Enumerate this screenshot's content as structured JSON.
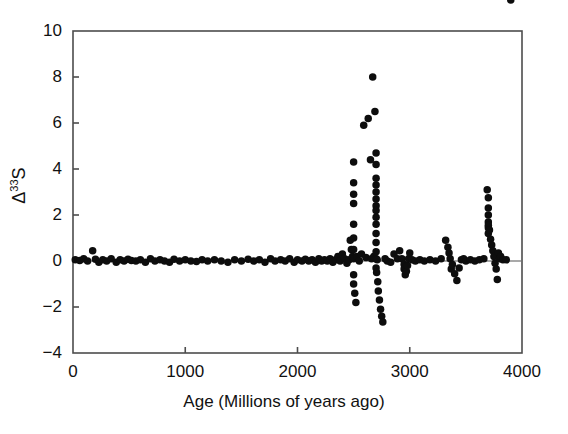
{
  "figure": {
    "background_color": "#ffffff",
    "axis_color": "#4d4d4d",
    "marker_color": "#0d0d0d",
    "zero_line_color": "#555555"
  },
  "axes": {
    "x_title": "Age (Millions of years ago)",
    "y_title_prefix": "Δ",
    "y_title_superscript": "33",
    "y_title_suffix": "S",
    "x_ticks": [
      0,
      1000,
      2000,
      3000,
      4000
    ],
    "x_tick_labels": [
      "0",
      "1000",
      "2000",
      "3000",
      "4000"
    ],
    "y_ticks": [
      -4,
      -2,
      0,
      2,
      4,
      6,
      8,
      10
    ],
    "y_tick_labels": [
      "-4",
      "-2",
      "0",
      "2",
      "4",
      "6",
      "8",
      "10"
    ]
  },
  "chart_data": {
    "type": "scatter",
    "title": "",
    "xlabel": "Age (Millions of years ago)",
    "ylabel": "Δ33S",
    "xlim": [
      0,
      4000
    ],
    "ylim": [
      -4,
      10
    ],
    "grid": false,
    "legend": "none",
    "marker": "filled-circle",
    "marker_color": "#0d0d0d",
    "marker_size_px": 7.5,
    "annotations": [
      "horizontal reference line at Δ33S = 0"
    ],
    "reference_lines": [
      {
        "axis": "y",
        "value": 0
      }
    ],
    "x": [
      20,
      60,
      95,
      130,
      175,
      200,
      230,
      265,
      300,
      340,
      385,
      420,
      455,
      490,
      520,
      560,
      600,
      645,
      690,
      730,
      775,
      815,
      860,
      900,
      950,
      1000,
      1050,
      1100,
      1150,
      1200,
      1260,
      1320,
      1380,
      1440,
      1500,
      1560,
      1610,
      1660,
      1710,
      1760,
      1800,
      1850,
      1890,
      1930,
      1970,
      2000,
      2040,
      2070,
      2100,
      2130,
      2160,
      2190,
      2215,
      2240,
      2265,
      2290,
      2315,
      2340,
      2360,
      2380,
      2400,
      2420,
      2440,
      2460,
      2470,
      2480,
      2490,
      2500,
      2500,
      2500,
      2500,
      2500,
      2500,
      2500,
      2500,
      2500,
      2500,
      2510,
      2520,
      2530,
      2550,
      2570,
      2590,
      2610,
      2630,
      2650,
      2660,
      2670,
      2680,
      2690,
      2700,
      2700,
      2700,
      2700,
      2700,
      2700,
      2700,
      2700,
      2700,
      2700,
      2700,
      2700,
      2700,
      2700,
      2700,
      2705,
      2710,
      2715,
      2720,
      2730,
      2740,
      2750,
      2760,
      2780,
      2800,
      2830,
      2860,
      2890,
      2910,
      2930,
      2950,
      2950,
      2960,
      2970,
      2980,
      2990,
      3000,
      3020,
      3050,
      3090,
      3130,
      3180,
      3230,
      3280,
      3320,
      3340,
      3350,
      3360,
      3370,
      3380,
      3400,
      3420,
      3440,
      3460,
      3480,
      3500,
      3540,
      3580,
      3620,
      3660,
      3690,
      3700,
      3700,
      3700,
      3700,
      3700,
      3700,
      3700,
      3710,
      3720,
      3730,
      3740,
      3750,
      3760,
      3770,
      3780,
      3790,
      3800,
      3810,
      3830,
      3860,
      3900
    ],
    "y": [
      0.05,
      0.02,
      0.1,
      0.0,
      0.45,
      0.08,
      -0.05,
      0.05,
      0.0,
      0.1,
      -0.05,
      0.05,
      0.0,
      0.08,
      0.02,
      0.0,
      0.05,
      -0.05,
      0.1,
      0.0,
      0.05,
      0.0,
      -0.05,
      0.08,
      0.0,
      0.05,
      0.0,
      -0.02,
      0.05,
      0.0,
      0.05,
      0.0,
      -0.05,
      0.05,
      0.0,
      0.08,
      0.0,
      0.05,
      -0.05,
      0.1,
      0.0,
      0.05,
      0.0,
      0.1,
      -0.05,
      0.05,
      0.0,
      0.08,
      0.0,
      0.05,
      -0.05,
      0.1,
      0.0,
      0.05,
      0.0,
      0.1,
      -0.05,
      0.05,
      0.2,
      0.0,
      0.3,
      0.1,
      -0.1,
      0.05,
      0.9,
      0.5,
      0.2,
      4.3,
      3.4,
      2.9,
      2.5,
      1.6,
      1.0,
      0.5,
      0.1,
      -0.6,
      -1.0,
      -1.4,
      -1.8,
      0.2,
      0.0,
      0.3,
      5.9,
      0.15,
      6.2,
      4.4,
      0.1,
      8.0,
      0.2,
      6.5,
      4.7,
      4.2,
      3.6,
      3.3,
      3.0,
      2.7,
      2.4,
      2.2,
      1.9,
      1.6,
      1.2,
      0.8,
      0.4,
      0.1,
      -0.3,
      -0.5,
      0.05,
      -0.9,
      -1.3,
      -1.7,
      -2.1,
      -2.4,
      -2.65,
      0.1,
      0.0,
      -0.05,
      0.3,
      0.1,
      0.45,
      0.1,
      -0.15,
      -0.35,
      -0.6,
      -0.45,
      -0.2,
      0.1,
      0.35,
      0.05,
      0.0,
      0.05,
      0.0,
      0.05,
      0.0,
      0.1,
      0.9,
      0.6,
      0.35,
      0.1,
      -0.35,
      -0.15,
      -0.55,
      -0.85,
      -0.3,
      0.05,
      0.1,
      0.0,
      0.05,
      0.0,
      0.05,
      0.1,
      3.1,
      2.75,
      2.3,
      2.0,
      1.7,
      1.45,
      1.2,
      1.55,
      1.35,
      0.95,
      0.7,
      0.45,
      0.2,
      -0.1,
      -0.35,
      -0.8,
      0.35,
      0.1,
      0.2,
      0.05,
      0.05
    ]
  }
}
